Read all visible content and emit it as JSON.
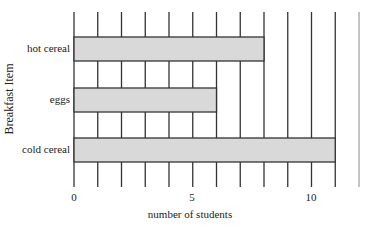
{
  "chart_data": {
    "type": "bar",
    "orientation": "horizontal",
    "title": "",
    "categories": [
      "hot cereal",
      "eggs",
      "cold cereal"
    ],
    "values": [
      8,
      6,
      11
    ],
    "xlabel": "number of students",
    "ylabel": "Breakfast Item",
    "xlim": [
      0,
      12
    ],
    "xticks": [
      0,
      5,
      10
    ],
    "grid": {
      "vertical": true,
      "step": 1
    },
    "legend": null,
    "colors": {
      "bar_fill": "#d9d9d9",
      "bar_stroke": "#333333",
      "grid": "#333333",
      "extra_line": "#888888"
    }
  },
  "labels": {
    "x_axis_title": "number of students",
    "y_axis_title": "Breakfast Item",
    "categories": [
      "hot cereal",
      "eggs",
      "cold cereal"
    ],
    "ticks": [
      "0",
      "5",
      "10"
    ]
  }
}
